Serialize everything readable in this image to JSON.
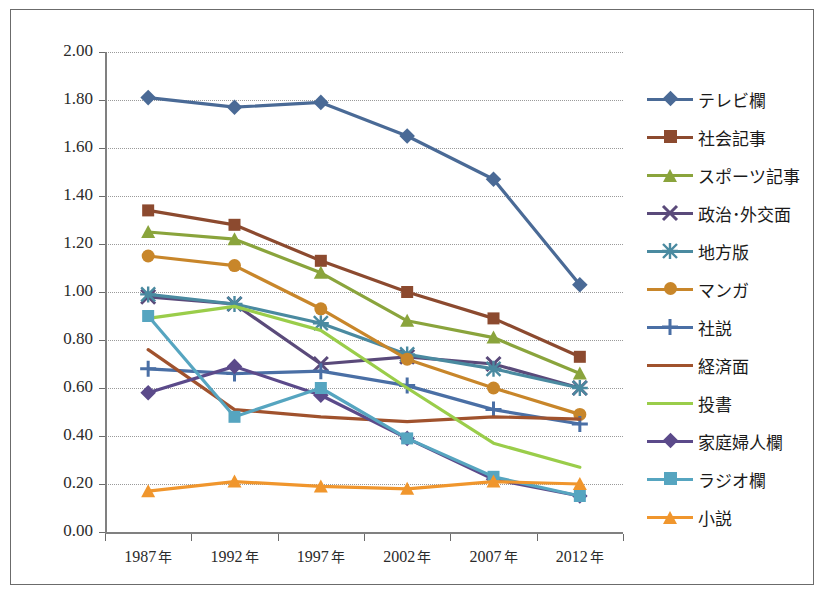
{
  "chart_data": {
    "type": "line",
    "title": "",
    "xlabel": "",
    "ylabel": "",
    "ylim": [
      0.0,
      2.0
    ],
    "ytick_step": 0.2,
    "grid": true,
    "legend_position": "right",
    "categories": [
      "1987 年",
      "1992 年",
      "1997 年",
      "2002 年",
      "2007 年",
      "2012 年"
    ],
    "ytick_labels": [
      "2.00",
      "1.80",
      "1.60",
      "1.40",
      "1.20",
      "1.00",
      "0.80",
      "0.60",
      "0.40",
      "0.20",
      "0.00"
    ],
    "series": [
      {
        "name": "テレビ欄",
        "color": "#4a6a96",
        "marker": "diamond",
        "values": [
          1.81,
          1.77,
          1.79,
          1.65,
          1.47,
          1.03
        ]
      },
      {
        "name": "社会記事",
        "color": "#8c4a2f",
        "marker": "square",
        "values": [
          1.34,
          1.28,
          1.13,
          1.0,
          0.89,
          0.73
        ]
      },
      {
        "name": "スポーツ記事",
        "color": "#8aa43c",
        "marker": "triangle",
        "values": [
          1.25,
          1.22,
          1.08,
          0.88,
          0.81,
          0.66
        ]
      },
      {
        "name": "政治･外交面",
        "color": "#5a4a7a",
        "marker": "x",
        "values": [
          0.98,
          0.95,
          0.7,
          0.73,
          0.7,
          0.6
        ]
      },
      {
        "name": "地方版",
        "color": "#4a8aa0",
        "marker": "star",
        "values": [
          0.99,
          0.95,
          0.87,
          0.74,
          0.68,
          0.6
        ]
      },
      {
        "name": "マンガ",
        "color": "#c8862a",
        "marker": "circle",
        "values": [
          1.15,
          1.11,
          0.93,
          0.72,
          0.6,
          0.49
        ]
      },
      {
        "name": "社説",
        "color": "#4a6fa5",
        "marker": "plus",
        "values": [
          0.68,
          0.66,
          0.67,
          0.61,
          0.51,
          0.45
        ]
      },
      {
        "name": "経済面",
        "color": "#a0522d",
        "marker": "none",
        "values": [
          0.76,
          0.51,
          0.48,
          0.46,
          0.48,
          0.47
        ]
      },
      {
        "name": "投書",
        "color": "#9acd4a",
        "marker": "none",
        "values": [
          0.89,
          0.94,
          0.84,
          0.6,
          0.37,
          0.27
        ]
      },
      {
        "name": "家庭婦人欄",
        "color": "#5b4a8a",
        "marker": "diamond",
        "values": [
          0.58,
          0.69,
          0.57,
          0.39,
          0.22,
          0.15
        ]
      },
      {
        "name": "ラジオ欄",
        "color": "#56a5c0",
        "marker": "square",
        "values": [
          0.9,
          0.48,
          0.6,
          0.39,
          0.23,
          0.15
        ]
      },
      {
        "name": "小説",
        "color": "#f0962d",
        "marker": "triangle",
        "values": [
          0.17,
          0.21,
          0.19,
          0.18,
          0.21,
          0.2
        ]
      }
    ]
  },
  "axes": {
    "y_min_label": "0.00",
    "y_max_label": "2.00"
  }
}
